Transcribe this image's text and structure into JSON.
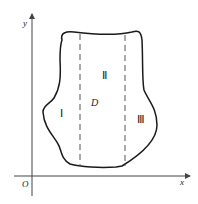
{
  "diagram": {
    "axes": {
      "x_label": "x",
      "y_label": "y",
      "origin_label": "O"
    },
    "region": {
      "label": "D",
      "subregions": [
        {
          "id": "I",
          "label": "Ⅰ"
        },
        {
          "id": "II",
          "label": "Ⅱ"
        },
        {
          "id": "III",
          "label": "Ⅲ"
        }
      ],
      "dividers": 2
    },
    "colors": {
      "stroke": "#1a1a1a",
      "dashed": "#555555",
      "axis": "#444444"
    }
  }
}
